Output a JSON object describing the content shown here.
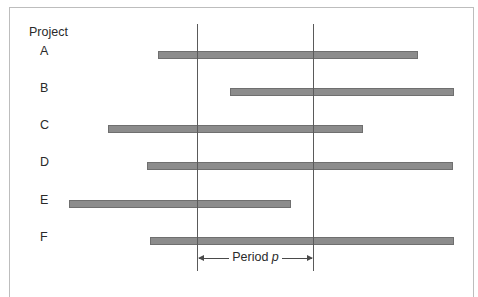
{
  "diagram": {
    "title": "Project",
    "period_label": "Period",
    "period_variable": "p",
    "colors": {
      "bar": "#8c8c8c",
      "bar_border": "#6f6f6f",
      "line": "#5a5a5a",
      "frame": "#bdbdbd"
    },
    "projects": [
      {
        "label": "A",
        "start_px": 158,
        "end_px": 418,
        "top_px": 51
      },
      {
        "label": "B",
        "start_px": 230,
        "end_px": 454,
        "top_px": 88
      },
      {
        "label": "C",
        "start_px": 108,
        "end_px": 363,
        "top_px": 125
      },
      {
        "label": "D",
        "start_px": 147,
        "end_px": 453,
        "top_px": 162
      },
      {
        "label": "E",
        "start_px": 69,
        "end_px": 291,
        "top_px": 200
      },
      {
        "label": "F",
        "start_px": 150,
        "end_px": 454,
        "top_px": 237
      }
    ],
    "period_bounds_px": [
      197,
      313
    ]
  }
}
